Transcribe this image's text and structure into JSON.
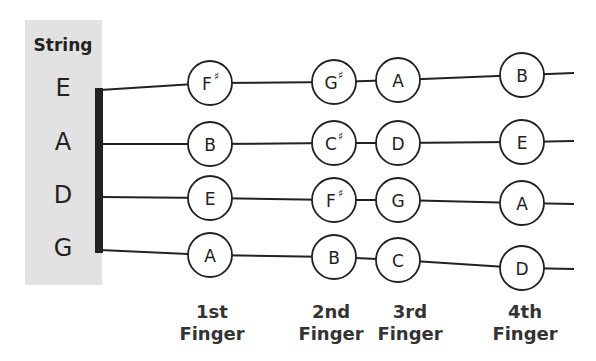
{
  "title": "String",
  "strings": [
    {
      "name": "E",
      "y_nut": 90,
      "y_end": 73,
      "notes": [
        {
          "finger": 1,
          "label": "F",
          "accidental": "♯",
          "x": 210,
          "y": 83
        },
        {
          "finger": 2,
          "label": "G",
          "accidental": "♯",
          "x": 334,
          "y": 82
        },
        {
          "finger": 3,
          "label": "A",
          "accidental": "",
          "x": 398,
          "y": 80
        },
        {
          "finger": 4,
          "label": "B",
          "accidental": "",
          "x": 522,
          "y": 75
        }
      ]
    },
    {
      "name": "A",
      "y_nut": 144,
      "y_end": 141,
      "notes": [
        {
          "finger": 1,
          "label": "B",
          "accidental": "",
          "x": 210,
          "y": 144
        },
        {
          "finger": 2,
          "label": "C",
          "accidental": "♯",
          "x": 334,
          "y": 143
        },
        {
          "finger": 3,
          "label": "D",
          "accidental": "",
          "x": 398,
          "y": 143
        },
        {
          "finger": 4,
          "label": "E",
          "accidental": "",
          "x": 522,
          "y": 142
        }
      ]
    },
    {
      "name": "D",
      "y_nut": 197,
      "y_end": 204,
      "notes": [
        {
          "finger": 1,
          "label": "E",
          "accidental": "",
          "x": 210,
          "y": 198
        },
        {
          "finger": 2,
          "label": "F",
          "accidental": "♯",
          "x": 334,
          "y": 200
        },
        {
          "finger": 3,
          "label": "G",
          "accidental": "",
          "x": 398,
          "y": 200
        },
        {
          "finger": 4,
          "label": "A",
          "accidental": "",
          "x": 522,
          "y": 203
        }
      ]
    },
    {
      "name": "G",
      "y_nut": 250,
      "y_end": 269,
      "notes": [
        {
          "finger": 1,
          "label": "A",
          "accidental": "",
          "x": 210,
          "y": 255
        },
        {
          "finger": 2,
          "label": "B",
          "accidental": "",
          "x": 334,
          "y": 257
        },
        {
          "finger": 3,
          "label": "C",
          "accidental": "",
          "x": 398,
          "y": 260
        },
        {
          "finger": 4,
          "label": "D",
          "accidental": "",
          "x": 522,
          "y": 268
        }
      ]
    }
  ],
  "fingers": [
    {
      "line1": "1st",
      "line2": "Finger",
      "x": 212
    },
    {
      "line1": "2nd",
      "line2": "Finger",
      "x": 331
    },
    {
      "line1": "3rd",
      "line2": "Finger",
      "x": 410
    },
    {
      "line1": "4th",
      "line2": "Finger",
      "x": 525
    }
  ],
  "colors": {
    "panel": "#e2e2e2",
    "ink": "#222222",
    "nut": "#222222"
  }
}
